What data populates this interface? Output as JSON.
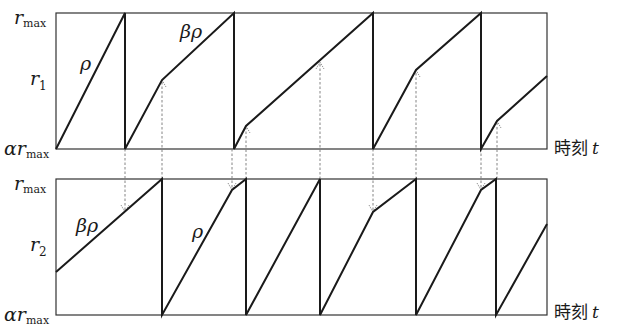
{
  "diagram": {
    "type": "sawtooth-timeline",
    "colors": {
      "line": "#1a1a1a",
      "frame": "#333333",
      "dashed": "#777777",
      "background": "#ffffff"
    },
    "top_panel": {
      "y_labels": {
        "max": "r",
        "max_sub": "max",
        "mid": "r",
        "mid_sub": "1",
        "min_prefix": "α",
        "min": "r",
        "min_sub": "max"
      },
      "x_label": {
        "text": "時刻",
        "var": "t"
      },
      "slope_labels": [
        {
          "text": "ρ"
        },
        {
          "text": "βρ"
        }
      ]
    },
    "bottom_panel": {
      "y_labels": {
        "max": "r",
        "max_sub": "max",
        "mid": "r",
        "mid_sub": "2",
        "min_prefix": "α",
        "min": "r",
        "min_sub": "max"
      },
      "x_label": {
        "text": "時刻",
        "var": "t"
      },
      "slope_labels": [
        {
          "text": "βρ"
        },
        {
          "text": "ρ"
        }
      ]
    }
  }
}
